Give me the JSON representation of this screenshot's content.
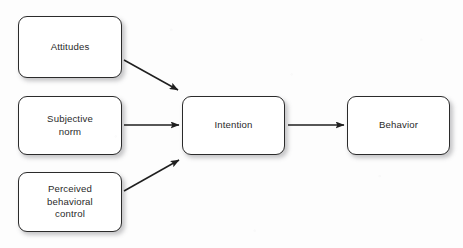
{
  "diagram": {
    "background_color": "#fdfdfd",
    "node_fill_color": "#ffffff",
    "node_border_color": "#2b2b2b",
    "arrow_color": "#1f1f1f",
    "text_color": "#2a2a2a",
    "nodes": [
      {
        "id": "attitudes",
        "label": "Attitudes",
        "x": 18,
        "y": 16,
        "w": 104,
        "h": 62
      },
      {
        "id": "subjective-norm",
        "label": "Subjective\nnorm",
        "x": 18,
        "y": 96,
        "w": 104,
        "h": 59
      },
      {
        "id": "perceived-behavioral-control",
        "label": "Perceived\nbehavioral\ncontrol",
        "x": 18,
        "y": 172,
        "w": 104,
        "h": 60
      },
      {
        "id": "intention",
        "label": "Intention",
        "x": 182,
        "y": 96,
        "w": 103,
        "h": 59
      },
      {
        "id": "behavior",
        "label": "Behavior",
        "x": 347,
        "y": 96,
        "w": 103,
        "h": 59
      }
    ],
    "edges": [
      {
        "id": "attitudes-to-intention",
        "from": "attitudes",
        "to": "intention",
        "x1": 124,
        "y1": 60,
        "x2": 178,
        "y2": 90
      },
      {
        "id": "subjective-norm-to-intention",
        "from": "subjective-norm",
        "to": "intention",
        "x1": 124,
        "y1": 125,
        "x2": 179,
        "y2": 125
      },
      {
        "id": "perceived-behavioral-control-to-intention",
        "from": "perceived-behavioral-control",
        "to": "intention",
        "x1": 124,
        "y1": 191,
        "x2": 179,
        "y2": 160
      },
      {
        "id": "intention-to-behavior",
        "from": "intention",
        "to": "behavior",
        "x1": 288,
        "y1": 125,
        "x2": 344,
        "y2": 125
      }
    ]
  }
}
